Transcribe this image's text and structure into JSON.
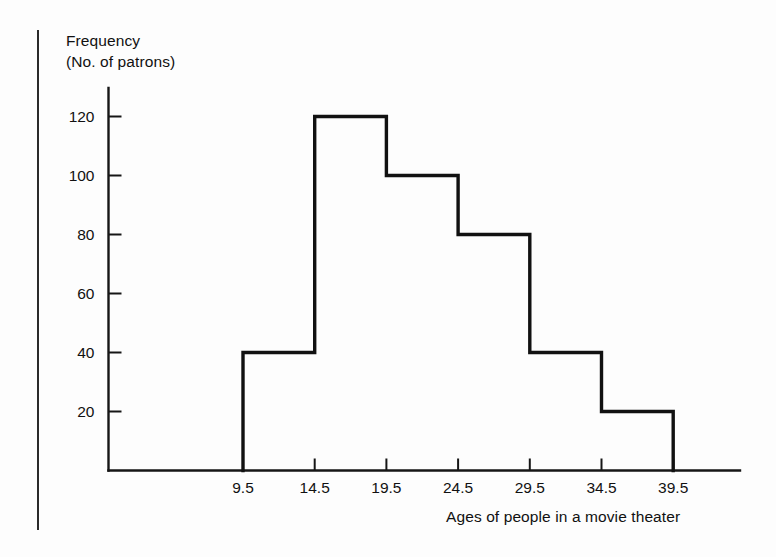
{
  "figure": {
    "y_axis_title_line1": "Frequency",
    "y_axis_title_line2": "(No. of patrons)",
    "caption": "Ages of people in a movie theater"
  },
  "chart_data": {
    "type": "bar",
    "title": "",
    "subtitle": "",
    "xlabel": "Ages of people in a movie theater",
    "ylabel": "Frequency (No. of patrons)",
    "bin_edges": [
      9.5,
      14.5,
      19.5,
      24.5,
      29.5,
      34.5,
      39.5
    ],
    "categories": [
      "9.5-14.5",
      "14.5-19.5",
      "19.5-24.5",
      "24.5-29.5",
      "29.5-34.5",
      "34.5-39.5"
    ],
    "values": [
      40,
      120,
      100,
      80,
      40,
      20
    ],
    "xtick_labels": [
      "9.5",
      "14.5",
      "19.5",
      "24.5",
      "29.5",
      "34.5",
      "39.5"
    ],
    "ytick_labels": [
      "20",
      "40",
      "60",
      "80",
      "100",
      "120"
    ],
    "ytick_values": [
      20,
      40,
      60,
      80,
      100,
      120
    ],
    "xlim": [
      9.5,
      39.5
    ],
    "ylim": [
      0,
      130
    ],
    "grid": false,
    "legend": false,
    "style": "outline-histogram",
    "line_color": "#111111",
    "fill_color": "none",
    "background_color": "#ffffff"
  },
  "ticks": {
    "y": [
      {
        "label": "120",
        "value": 120
      },
      {
        "label": "100",
        "value": 100
      },
      {
        "label": "80",
        "value": 80
      },
      {
        "label": "60",
        "value": 60
      },
      {
        "label": "40",
        "value": 40
      },
      {
        "label": "20",
        "value": 20
      }
    ],
    "x": [
      {
        "label": "9.5",
        "value": 9.5
      },
      {
        "label": "14.5",
        "value": 14.5
      },
      {
        "label": "19.5",
        "value": 19.5
      },
      {
        "label": "24.5",
        "value": 24.5
      },
      {
        "label": "29.5",
        "value": 29.5
      },
      {
        "label": "34.5",
        "value": 34.5
      },
      {
        "label": "39.5",
        "value": 39.5
      }
    ]
  }
}
